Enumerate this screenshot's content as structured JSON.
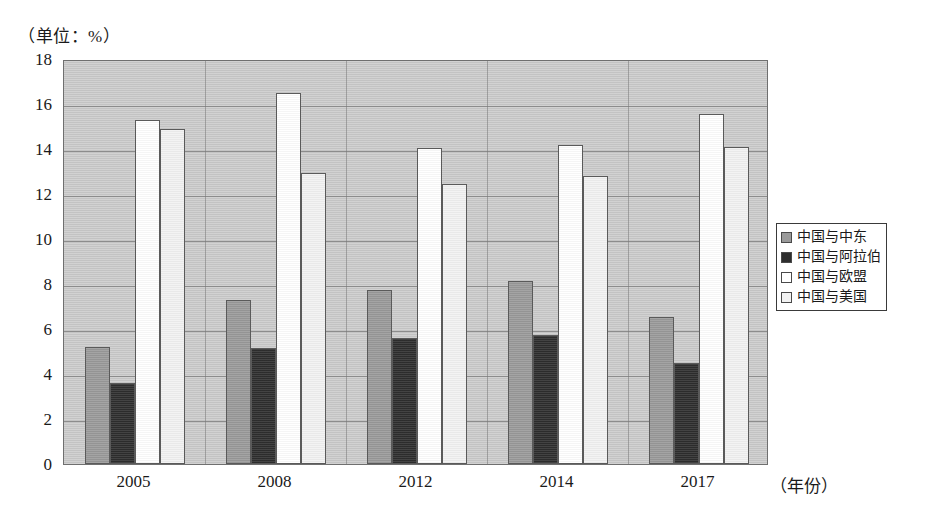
{
  "unit_caption": "（单位：%）",
  "x_axis_title": "（年份）",
  "legend": {
    "items": [
      {
        "label": "中国与中东",
        "color": "#9a9a9a",
        "swatch_name": "legend-swatch-middle-east"
      },
      {
        "label": "中国与阿拉伯",
        "color": "#2e2e2e",
        "swatch_name": "legend-swatch-arab"
      },
      {
        "label": "中国与欧盟",
        "color": "#ffffff",
        "swatch_name": "legend-swatch-eu"
      },
      {
        "label": "中国与美国",
        "color": "#f2f2f2",
        "swatch_name": "legend-swatch-usa"
      }
    ]
  },
  "chart_data": {
    "type": "bar",
    "title": "",
    "subtitle": "",
    "xlabel": "（年份）",
    "ylabel": "（单位：%）",
    "categories": [
      "2005",
      "2008",
      "2012",
      "2014",
      "2017"
    ],
    "ylim": [
      0,
      18
    ],
    "ytick_step": 2,
    "yticks": [
      "18",
      "16",
      "14",
      "12",
      "10",
      "8",
      "6",
      "4",
      "2",
      "0"
    ],
    "grid": true,
    "legend_position": "right",
    "series": [
      {
        "name": "中国与中东",
        "color": "#9a9a9a",
        "values": [
          5.2,
          7.3,
          7.75,
          8.15,
          6.55
        ]
      },
      {
        "name": "中国与阿拉伯",
        "color": "#2e2e2e",
        "values": [
          3.6,
          5.15,
          5.6,
          5.75,
          4.5
        ]
      },
      {
        "name": "中国与欧盟",
        "color": "#ffffff",
        "values": [
          15.3,
          16.5,
          14.05,
          14.2,
          15.55
        ]
      },
      {
        "name": "中国与美国",
        "color": "#f2f2f2",
        "values": [
          14.9,
          12.95,
          12.45,
          12.8,
          14.1
        ]
      }
    ]
  }
}
